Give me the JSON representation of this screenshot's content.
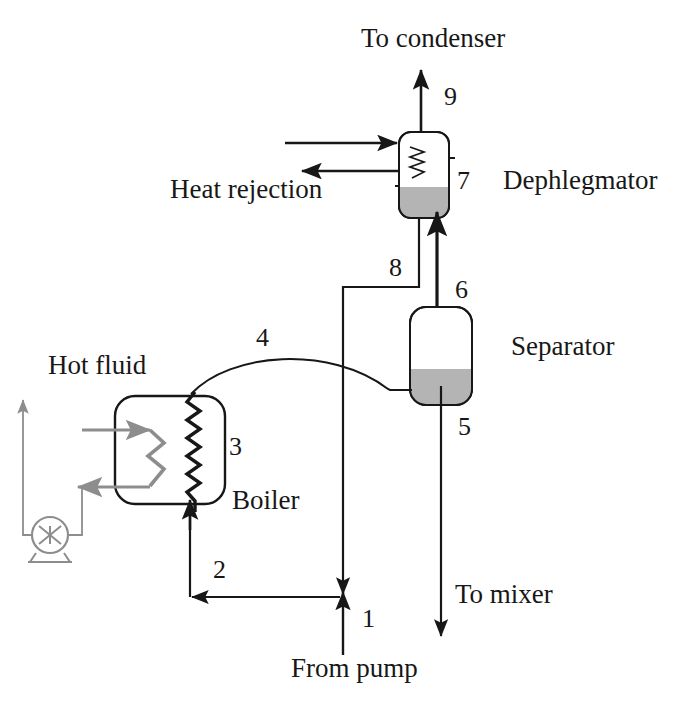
{
  "diagram": {
    "colors": {
      "line": "#171717",
      "hot_fluid": "#8d8d8d",
      "liquid_fill": "#b4b4b4",
      "background": "#ffffff"
    },
    "equipment": [
      {
        "id": "boiler",
        "label": "Boiler",
        "stream_tag": "3"
      },
      {
        "id": "separator",
        "label": "Separator"
      },
      {
        "id": "dephlegmator",
        "label": "Dephlegmator",
        "stream_tag": "7"
      }
    ],
    "labels": {
      "to_condenser": "To condenser",
      "heat_rejection": "Heat rejection",
      "dephlegmator": "Dephlegmator",
      "separator": "Separator",
      "hot_fluid": "Hot fluid",
      "boiler": "Boiler",
      "to_mixer": "To mixer",
      "from_pump": "From pump"
    },
    "stream_numbers": {
      "s1": "1",
      "s2": "2",
      "s3": "3",
      "s4": "4",
      "s5": "5",
      "s6": "6",
      "s7": "7",
      "s8": "8",
      "s9": "9"
    },
    "stream_descriptions": [
      {
        "number": "1",
        "from": "From pump",
        "to": "tee junction"
      },
      {
        "number": "2",
        "from": "tee junction",
        "to": "boiler inlet"
      },
      {
        "number": "3",
        "from": "boiler coil",
        "to": "boiler coil outlet"
      },
      {
        "number": "4",
        "from": "boiler coil outlet",
        "to": "separator"
      },
      {
        "number": "5",
        "from": "separator bottom",
        "to": "To mixer"
      },
      {
        "number": "6",
        "from": "separator top",
        "to": "dephlegmator bottom"
      },
      {
        "number": "7",
        "from": "dephlegmator",
        "to": "dephlegmator"
      },
      {
        "number": "8",
        "from": "dephlegmator bottom drain",
        "to": "tee junction"
      },
      {
        "number": "9",
        "from": "dephlegmator top",
        "to": "To condenser"
      }
    ]
  }
}
